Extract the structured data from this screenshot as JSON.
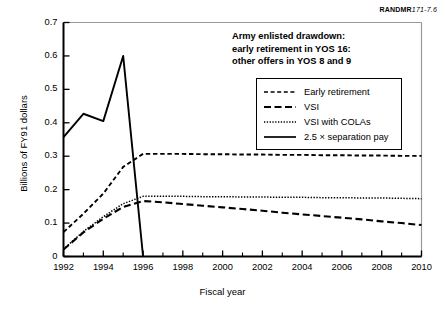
{
  "figure": {
    "rand_id_bold": "RANDMR",
    "rand_id_italic": "171-7.6"
  },
  "annotation": {
    "line1": "Army enlisted drawdown:",
    "line2": "early retirement in YOS 16:",
    "line3": "other offers in YOS 8 and 9"
  },
  "chart_data": {
    "type": "line",
    "title": "Army enlisted drawdown: early retirement in YOS 16: other offers in YOS 8 and 9",
    "xlabel": "Fiscal year",
    "ylabel": "Billions of FY91 dollars",
    "xlim": [
      1992,
      2010
    ],
    "ylim": [
      0,
      0.7
    ],
    "grid": false,
    "legend_position": "upper right",
    "x": [
      1992,
      1993,
      1994,
      1995,
      1996,
      1997,
      1998,
      1999,
      2000,
      2001,
      2002,
      2003,
      2004,
      2005,
      2006,
      2007,
      2008,
      2009,
      2010
    ],
    "xticks": [
      1992,
      1994,
      1996,
      1998,
      2000,
      2002,
      2004,
      2006,
      2008,
      2010
    ],
    "xtick_labels": [
      "1992",
      "1994",
      "1996",
      "1998",
      "2000",
      "2002",
      "2004",
      "2006",
      "2008",
      "2010"
    ],
    "xminor_ticks": [
      1993,
      1995,
      1997,
      1999,
      2001,
      2003,
      2005,
      2007,
      2009
    ],
    "yticks": [
      0,
      0.1,
      0.2,
      0.3,
      0.4,
      0.5,
      0.6,
      0.7
    ],
    "ytick_labels": [
      "0",
      "0.1",
      "0.2",
      "0.3",
      "0.4",
      "0.5",
      "0.6",
      "0.7"
    ],
    "series": [
      {
        "name": "Early retirement",
        "style": "dashed",
        "values": [
          0.073,
          0.128,
          0.188,
          0.268,
          0.307,
          0.307,
          0.307,
          0.306,
          0.306,
          0.305,
          0.305,
          0.304,
          0.304,
          0.303,
          0.303,
          0.302,
          0.302,
          0.301,
          0.301
        ]
      },
      {
        "name": "VSI",
        "style": "long-dashed",
        "values": [
          0.021,
          0.072,
          0.113,
          0.148,
          0.166,
          0.162,
          0.157,
          0.152,
          0.147,
          0.142,
          0.137,
          0.131,
          0.126,
          0.121,
          0.116,
          0.111,
          0.105,
          0.1,
          0.094
        ]
      },
      {
        "name": "VSI with COLAs",
        "style": "dotted",
        "values": [
          0.022,
          0.075,
          0.119,
          0.158,
          0.18,
          0.18,
          0.18,
          0.179,
          0.179,
          0.178,
          0.178,
          0.177,
          0.177,
          0.176,
          0.176,
          0.175,
          0.175,
          0.174,
          0.173
        ]
      },
      {
        "name": "2.5 × separation pay",
        "style": "solid",
        "values": [
          0.357,
          0.427,
          0.405,
          0.6,
          0.0,
          null,
          null,
          null,
          null,
          null,
          null,
          null,
          null,
          null,
          null,
          null,
          null,
          null,
          null
        ]
      }
    ]
  },
  "legend": {
    "items": [
      {
        "label": "Early retirement"
      },
      {
        "label": "VSI"
      },
      {
        "label": "VSI with COLAs"
      },
      {
        "label": "2.5 × separation pay"
      }
    ]
  }
}
